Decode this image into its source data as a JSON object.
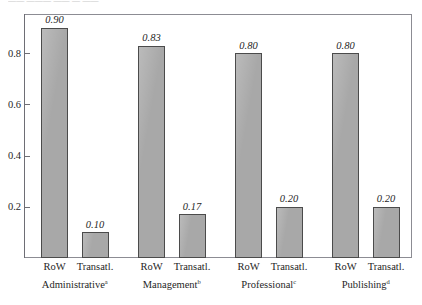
{
  "figure": {
    "caption_remnant": "—— ——— —— — ——",
    "bar_fill_color": "#a8a8a8",
    "bar_border_color": "#4b4b4b",
    "frame_color": "#8c8c93"
  },
  "chart_data": {
    "type": "bar",
    "title": "",
    "subtitle": "",
    "xlabel": "",
    "ylabel": "",
    "ylim": [
      0,
      0.95
    ],
    "grid": false,
    "legend": false,
    "legend_position": "none",
    "ytick_labels": [
      "0.2",
      "0.4",
      "0.6",
      "0.8"
    ],
    "ytick_values": [
      0.2,
      0.4,
      0.6,
      0.8
    ],
    "categories": [
      "Administrative",
      "Management",
      "Professional",
      "Publishing"
    ],
    "category_footnotes": [
      "a",
      "b",
      "c",
      "d"
    ],
    "series": [
      {
        "name": "RoW",
        "values": [
          0.9,
          0.83,
          0.8,
          0.8
        ],
        "labels": [
          "0.90",
          "0.83",
          "0.80",
          "0.80"
        ]
      },
      {
        "name": "Transatl.",
        "values": [
          0.1,
          0.17,
          0.2,
          0.2
        ],
        "labels": [
          "0.10",
          "0.17",
          "0.20",
          "0.20"
        ]
      }
    ],
    "groups": [
      {
        "category": "Administrative",
        "footnote": "a",
        "bars": [
          {
            "series": "RoW",
            "value": 0.9,
            "label": "0.90"
          },
          {
            "series": "Transatl.",
            "value": 0.1,
            "label": "0.10"
          }
        ]
      },
      {
        "category": "Management",
        "footnote": "b",
        "bars": [
          {
            "series": "RoW",
            "value": 0.83,
            "label": "0.83"
          },
          {
            "series": "Transatl.",
            "value": 0.17,
            "label": "0.17"
          }
        ]
      },
      {
        "category": "Professional",
        "footnote": "c",
        "bars": [
          {
            "series": "RoW",
            "value": 0.8,
            "label": "0.80"
          },
          {
            "series": "Transatl.",
            "value": 0.2,
            "label": "0.20"
          }
        ]
      },
      {
        "category": "Publishing",
        "footnote": "d",
        "bars": [
          {
            "series": "RoW",
            "value": 0.8,
            "label": "0.80"
          },
          {
            "series": "Transatl.",
            "value": 0.2,
            "label": "0.20"
          }
        ]
      }
    ]
  }
}
